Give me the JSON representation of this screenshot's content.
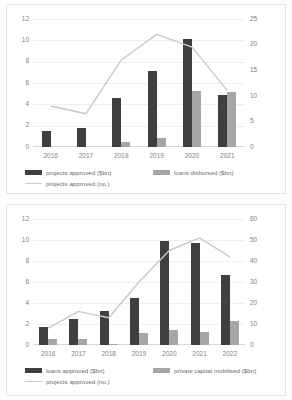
{
  "charts": [
    {
      "id": "chart-1",
      "legend": {
        "primary": "projects approved ($bn)",
        "secondary": "loans disbursed ($bn)",
        "line": "projects approved (no.)"
      },
      "colors": {
        "primary": "#3f3f3f",
        "secondary": "#a6a6a6",
        "line": "#c9c9c9",
        "grid": "#eeeeee",
        "text": "#7f7f7f"
      },
      "chart_data": {
        "type": "bar",
        "title": "",
        "xlabel": "",
        "ylabel": "",
        "categories": [
          "2016",
          "2017",
          "2018",
          "2019",
          "2020",
          "2021"
        ],
        "ylim": [
          0,
          12
        ],
        "y2lim": [
          0,
          25
        ],
        "yticks": [
          0,
          2,
          4,
          6,
          8,
          10,
          12
        ],
        "y2ticks": [
          0,
          5,
          10,
          15,
          20,
          25
        ],
        "grid": true,
        "legend_position": "bottom",
        "series": [
          {
            "name": "projects approved ($bn)",
            "type": "bar",
            "axis": "left",
            "values": [
              1.5,
              1.8,
              4.6,
              7.1,
              10.1,
              4.9
            ]
          },
          {
            "name": "loans disbursed ($bn)",
            "type": "bar",
            "axis": "left",
            "values": [
              0,
              0,
              0.5,
              0.85,
              5.25,
              5.2
            ]
          },
          {
            "name": "projects approved (no.)",
            "type": "line",
            "axis": "right",
            "values": [
              8,
              6.5,
              17,
              22,
              19.5,
              11
            ]
          }
        ]
      }
    },
    {
      "id": "chart-2",
      "legend": {
        "primary": "loans approved ($bn)",
        "secondary": "private capital mobilised ($bn)",
        "line": "projects approved (no.)"
      },
      "colors": {
        "primary": "#3f3f3f",
        "secondary": "#a6a6a6",
        "line": "#c9c9c9",
        "grid": "#eeeeee",
        "text": "#7f7f7f"
      },
      "chart_data": {
        "type": "bar",
        "title": "",
        "xlabel": "",
        "ylabel": "",
        "categories": [
          "2016",
          "2017",
          "2018",
          "2019",
          "2020",
          "2021",
          "2022"
        ],
        "ylim": [
          0,
          12
        ],
        "y2lim": [
          0,
          60
        ],
        "yticks": [
          0,
          2,
          4,
          6,
          8,
          10,
          12
        ],
        "y2ticks": [
          0,
          10,
          20,
          30,
          40,
          50,
          60
        ],
        "grid": true,
        "legend_position": "bottom",
        "series": [
          {
            "name": "loans approved ($bn)",
            "type": "bar",
            "axis": "left",
            "values": [
              1.7,
              2.45,
              3.2,
              4.45,
              9.9,
              9.7,
              6.7
            ]
          },
          {
            "name": "private capital mobilised ($bn)",
            "type": "bar",
            "axis": "left",
            "values": [
              0.55,
              0.55,
              0.08,
              1.15,
              1.4,
              1.25,
              2.3
            ]
          },
          {
            "name": "projects approved (no.)",
            "type": "line",
            "axis": "right",
            "values": [
              8,
              16,
              13,
              30,
              45,
              51,
              42
            ]
          }
        ]
      }
    }
  ]
}
